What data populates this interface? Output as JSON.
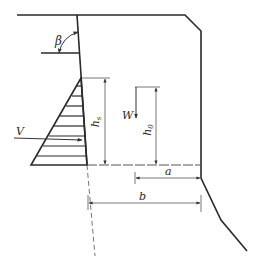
{
  "figure": {
    "type": "engineering-cross-section",
    "colors": {
      "line": "#2a2a2a",
      "dim": "#555555",
      "dashed": "#777777",
      "background": "#ffffff"
    }
  },
  "labels": {
    "beta": "β",
    "V": "V",
    "W": "W",
    "hs_main": "h",
    "hs_sub": "s",
    "h0_main": "h",
    "h0_sub": "0",
    "a": "a",
    "b": "b"
  }
}
